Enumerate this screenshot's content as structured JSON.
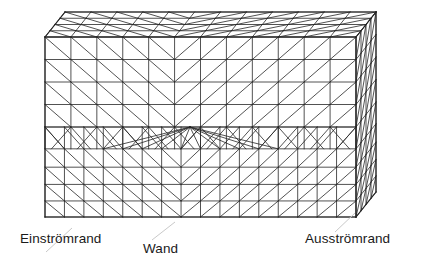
{
  "figure": {
    "type": "3d-mesh-diagram",
    "projection": "oblique",
    "line_color": "#262626",
    "background_color": "#ffffff",
    "label_color": "#1a1a1a"
  },
  "labels": {
    "inflow": "Einströmrand",
    "wall": "Wand",
    "outflow": "Ausströmrand"
  },
  "leaders": {
    "inflow": {
      "x1": 72,
      "y1": 228,
      "x2": 46,
      "y2": 252
    },
    "wall": {
      "x1": 175,
      "y1": 222,
      "x2": 152,
      "y2": 240
    },
    "outflow": {
      "x1": 355,
      "y1": 213,
      "x2": 335,
      "y2": 232
    }
  },
  "geometry": {
    "front_face": {
      "x_left": 45,
      "x_right": 356,
      "y_top": 37,
      "y_bottom": 217,
      "coarse_rows": 4,
      "coarse_cols": 12,
      "fine_rows": 5,
      "fine_cols": 16,
      "coarse_bottom_y": 127,
      "center_x": 190,
      "fan_node": {
        "x": 190,
        "y": 127
      }
    },
    "depth_vector": {
      "dx": 20,
      "dy": -25
    },
    "top_face": {
      "rows": 4,
      "cols": 12
    },
    "side_face": {
      "rows": 9,
      "cols": 4
    }
  },
  "chart_data": {
    "type": "table",
    "categories": [
      "Einströmrand",
      "Wand",
      "Ausströmrand"
    ],
    "values": [
      1,
      1,
      1
    ]
  }
}
